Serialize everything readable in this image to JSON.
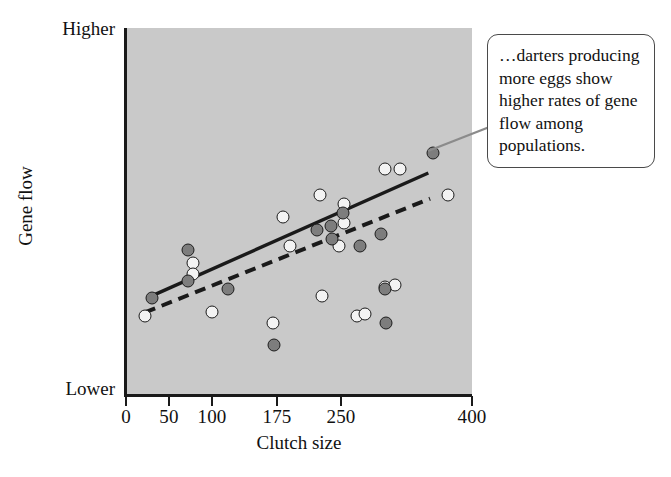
{
  "figure": {
    "background_color": "#ffffff",
    "plot_background_color": "#c9c9c9",
    "axis_color": "#1a1a1a"
  },
  "annotation": {
    "text": "…darters producing more eggs show higher rates of gene flow among populations.",
    "border_color": "#4a4a4a",
    "leader_color": "#888888"
  },
  "chart_data": {
    "type": "scatter",
    "title": "",
    "xlabel": "Clutch size",
    "ylabel": "Gene flow",
    "xlim": [
      0,
      400
    ],
    "ylim": [
      0,
      1
    ],
    "grid": false,
    "legend_position": "none",
    "y_axis_qualitative": true,
    "y_tick_labels": [
      "Higher",
      "Lower"
    ],
    "x_tick_values": [
      0,
      50,
      100,
      175,
      250,
      400
    ],
    "x_tick_labels": [
      "0",
      "50",
      "100",
      "175",
      "250",
      "400"
    ],
    "series": [
      {
        "name": "open",
        "marker": "open-circle",
        "fill_color": "#f3f3f3",
        "edge_color": "#1c1c1c",
        "points": [
          {
            "x": 22,
            "y": 0.215
          },
          {
            "x": 78,
            "y": 0.36
          },
          {
            "x": 78,
            "y": 0.33
          },
          {
            "x": 100,
            "y": 0.225
          },
          {
            "x": 170,
            "y": 0.195
          },
          {
            "x": 182,
            "y": 0.485
          },
          {
            "x": 190,
            "y": 0.405
          },
          {
            "x": 225,
            "y": 0.545
          },
          {
            "x": 228,
            "y": 0.27
          },
          {
            "x": 248,
            "y": 0.405
          },
          {
            "x": 253,
            "y": 0.52
          },
          {
            "x": 253,
            "y": 0.47
          },
          {
            "x": 268,
            "y": 0.215
          },
          {
            "x": 278,
            "y": 0.22
          },
          {
            "x": 300,
            "y": 0.295
          },
          {
            "x": 312,
            "y": 0.3
          },
          {
            "x": 300,
            "y": 0.615
          },
          {
            "x": 318,
            "y": 0.615
          },
          {
            "x": 372,
            "y": 0.545
          }
        ]
      },
      {
        "name": "filled",
        "marker": "filled-circle",
        "fill_color": "#7d7d7d",
        "edge_color": "#1c1c1c",
        "points": [
          {
            "x": 30,
            "y": 0.265
          },
          {
            "x": 72,
            "y": 0.31
          },
          {
            "x": 72,
            "y": 0.395
          },
          {
            "x": 118,
            "y": 0.29
          },
          {
            "x": 172,
            "y": 0.135
          },
          {
            "x": 222,
            "y": 0.45
          },
          {
            "x": 238,
            "y": 0.46
          },
          {
            "x": 240,
            "y": 0.425
          },
          {
            "x": 252,
            "y": 0.495
          },
          {
            "x": 272,
            "y": 0.405
          },
          {
            "x": 296,
            "y": 0.44
          },
          {
            "x": 300,
            "y": 0.29
          },
          {
            "x": 302,
            "y": 0.195
          },
          {
            "x": 355,
            "y": 0.66
          }
        ]
      }
    ],
    "trend_lines": [
      {
        "name": "solid-regression-line",
        "style": "solid",
        "color": "#1a1a1a",
        "x_start": 30,
        "y_start": 0.27,
        "x_end": 350,
        "y_end": 0.605
      },
      {
        "name": "dashed-regression-line",
        "style": "dashed",
        "color": "#1a1a1a",
        "x_start": 22,
        "y_start": 0.225,
        "x_end": 352,
        "y_end": 0.535
      }
    ]
  }
}
